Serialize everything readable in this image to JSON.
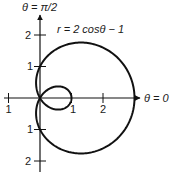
{
  "chart_data": {
    "type": "line",
    "subtype": "polar",
    "title": "",
    "equation": "r = 2cosθ − 1",
    "function": {
      "a": 2,
      "b": -1,
      "form": "r = a*cos(theta) + b"
    },
    "theta_range": [
      0,
      6.283185
    ],
    "axis_labels": {
      "polar_axis": "θ = 0",
      "vertical_axis": "θ = π/2"
    },
    "x_ticks": [
      {
        "value": -1,
        "label": "1"
      },
      {
        "value": 1,
        "label": "1"
      },
      {
        "value": 2,
        "label": "2"
      }
    ],
    "y_ticks": [
      {
        "value": 2,
        "label": "2"
      },
      {
        "value": 1,
        "label": "1"
      },
      {
        "value": -1,
        "label": "1"
      },
      {
        "value": -2,
        "label": "2"
      }
    ],
    "xlim": [
      -1.2,
      3.0
    ],
    "ylim": [
      -2.3,
      2.6
    ],
    "grid": false,
    "legend": "none",
    "key_points": [
      {
        "theta": "0",
        "r": 3
      },
      {
        "theta": "π/3",
        "r": 0
      },
      {
        "theta": "π",
        "r": -3
      }
    ]
  },
  "labels": {
    "vertical_axis_title": "θ = π/2",
    "horizontal_axis_title": "θ = 0",
    "equation": "r = 2 cosθ − 1",
    "tick_x_neg1": "1",
    "tick_x_1": "1",
    "tick_x_2": "2",
    "tick_y_2": "2",
    "tick_y_1": "1",
    "tick_y_neg1": "1",
    "tick_y_neg2": "2"
  },
  "layout": {
    "origin": [
      40,
      98
    ],
    "scale": 31.5,
    "stroke": "#111111"
  }
}
